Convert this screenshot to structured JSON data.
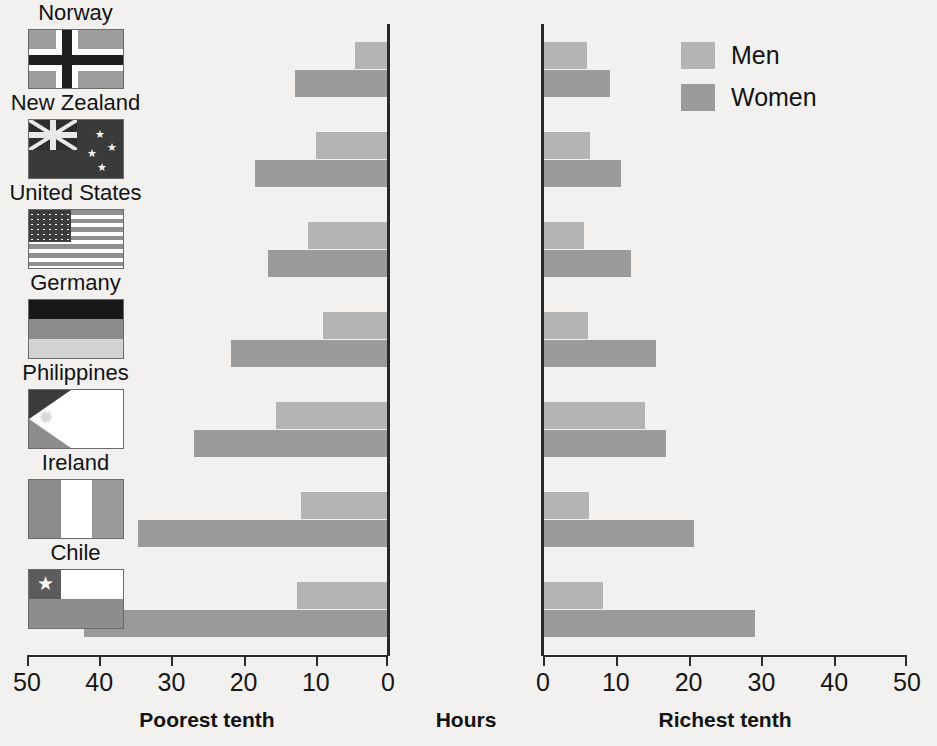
{
  "chart_data": {
    "type": "bar",
    "title": "",
    "subtitle": "",
    "orientation": "horizontal-diverging",
    "categories": [
      "Norway",
      "New Zealand",
      "United States",
      "Germany",
      "Philippines",
      "Ireland",
      "Chile"
    ],
    "panels": [
      {
        "name": "poorest",
        "caption": "Poorest tenth",
        "direction": "left",
        "axis": {
          "ticks": [
            50,
            40,
            30,
            20,
            10,
            0
          ],
          "min": 0,
          "max": 50,
          "reversed": true
        },
        "series": [
          {
            "name": "Men",
            "values": [
              4.5,
              10.0,
              11.0,
              9.0,
              15.5,
              12.0,
              12.6
            ]
          },
          {
            "name": "Women",
            "values": [
              12.8,
              18.3,
              16.5,
              21.7,
              26.7,
              34.5,
              42.0
            ]
          }
        ]
      },
      {
        "name": "richest",
        "caption": "Richest tenth",
        "direction": "right",
        "axis": {
          "ticks": [
            0,
            10,
            20,
            30,
            40,
            50
          ],
          "min": 0,
          "max": 50,
          "reversed": false
        },
        "series": [
          {
            "name": "Men",
            "values": [
              6.0,
              6.5,
              5.6,
              6.2,
              14.0,
              6.4,
              8.3
            ]
          },
          {
            "name": "Women",
            "values": [
              9.3,
              10.8,
              12.2,
              15.6,
              17.0,
              20.8,
              29.3
            ]
          }
        ]
      }
    ],
    "center_caption": "Hours",
    "xlabel": "Hours",
    "ylabel": "",
    "grid": false,
    "legend_position": "top-right",
    "legend": [
      {
        "label": "Men",
        "color": "#b4b4b4"
      },
      {
        "label": "Women",
        "color": "#9a9a9a"
      }
    ]
  },
  "flags": [
    {
      "country": "Norway",
      "icon": "flag-norway-icon"
    },
    {
      "country": "New Zealand",
      "icon": "flag-new-zealand-icon"
    },
    {
      "country": "United States",
      "icon": "flag-united-states-icon"
    },
    {
      "country": "Germany",
      "icon": "flag-germany-icon"
    },
    {
      "country": "Philippines",
      "icon": "flag-philippines-icon"
    },
    {
      "country": "Ireland",
      "icon": "flag-ireland-icon"
    },
    {
      "country": "Chile",
      "icon": "flag-chile-icon"
    }
  ],
  "colors": {
    "background": "#f2f1ef",
    "men": "#b4b4b4",
    "women": "#9a9a9a",
    "axis": "#2b2b2b",
    "text": "#111111"
  }
}
